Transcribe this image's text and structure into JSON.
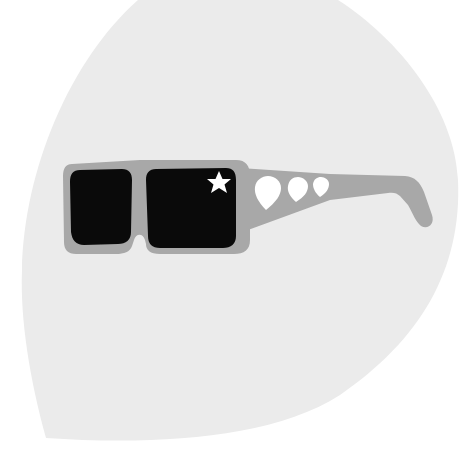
{
  "illustration": {
    "subject": "sunglasses",
    "background_shape": "teardrop",
    "decorations": {
      "star_count": 1,
      "drop_count": 3
    }
  },
  "colors": {
    "page_background": "#ffffff",
    "teardrop_fill": "#ebebeb",
    "frame_fill": "#a8a8a8",
    "lens_fill": "#0a0a0a",
    "accent_white": "#ffffff"
  }
}
